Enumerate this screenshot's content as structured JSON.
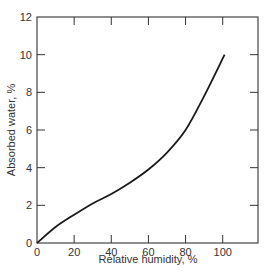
{
  "chart_data": {
    "type": "line",
    "title": "",
    "xlabel": "Relative humidity, %",
    "ylabel": "Absorbed water, %",
    "xlim": [
      0,
      119
    ],
    "ylim": [
      0,
      12
    ],
    "x_ticks": [
      0,
      20,
      40,
      60,
      80,
      100
    ],
    "y_ticks": [
      0,
      2,
      4,
      6,
      8,
      10,
      12
    ],
    "grid": false,
    "legend": null,
    "series": [
      {
        "name": "Absorbed water",
        "x": [
          0,
          10,
          20,
          30,
          40,
          50,
          60,
          70,
          80,
          90,
          101
        ],
        "y": [
          0,
          0.85,
          1.5,
          2.1,
          2.6,
          3.2,
          3.9,
          4.8,
          6.0,
          7.8,
          10.0
        ]
      }
    ]
  }
}
